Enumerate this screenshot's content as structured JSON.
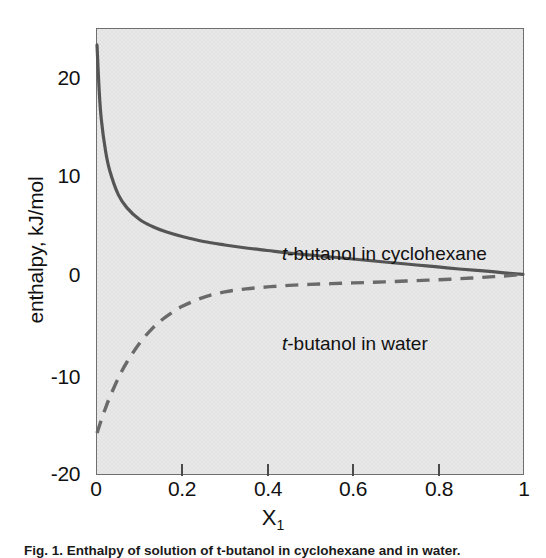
{
  "chart_data": {
    "type": "line",
    "title": "",
    "xlabel": "X1",
    "xlabel_base": "X",
    "xlabel_sub": "1",
    "ylabel": "enthalpy, kJ/mol",
    "xlim": [
      0,
      1
    ],
    "ylim": [
      -20,
      24.6
    ],
    "grid": false,
    "legend_position": "inline-annotations",
    "xticks": [
      "0",
      "0.2",
      "0.4",
      "0.6",
      "0.8",
      "1"
    ],
    "xtick_values": [
      0,
      0.2,
      0.4,
      0.6,
      0.8,
      1
    ],
    "yticks": [
      "20",
      "10",
      "0",
      "-10",
      "-20"
    ],
    "ytick_values": [
      20,
      10,
      0,
      -10,
      -20
    ],
    "plot_background_color": "#e2e2e2",
    "axis_color": "#6f6f6f",
    "series": [
      {
        "name": "t-butanol in cyclohexane",
        "style": "solid",
        "color": "#555555",
        "x": [
          0.0,
          0.005,
          0.01,
          0.02,
          0.03,
          0.05,
          0.07,
          0.1,
          0.13,
          0.16,
          0.2,
          0.25,
          0.3,
          0.35,
          0.4,
          0.45,
          0.5,
          0.55,
          0.6,
          0.65,
          0.7,
          0.75,
          0.8,
          0.85,
          0.9,
          0.95,
          1.0
        ],
        "y": [
          23.0,
          18.5,
          15.6,
          12.4,
          10.4,
          8.0,
          6.7,
          5.5,
          4.8,
          4.3,
          3.8,
          3.3,
          2.95,
          2.65,
          2.4,
          2.15,
          1.95,
          1.75,
          1.55,
          1.35,
          1.15,
          0.95,
          0.75,
          0.55,
          0.38,
          0.19,
          0.0
        ]
      },
      {
        "name": "t-butanol in water",
        "style": "dashed",
        "color": "#6a6a6a",
        "x": [
          0.0,
          0.01,
          0.02,
          0.03,
          0.05,
          0.07,
          0.1,
          0.13,
          0.16,
          0.2,
          0.25,
          0.3,
          0.35,
          0.4,
          0.45,
          0.5,
          0.55,
          0.6,
          0.65,
          0.7,
          0.75,
          0.8,
          0.85,
          0.9,
          0.95,
          1.0
        ],
        "y": [
          -15.9,
          -14.6,
          -13.4,
          -12.3,
          -10.4,
          -8.8,
          -6.9,
          -5.4,
          -4.3,
          -3.2,
          -2.3,
          -1.75,
          -1.45,
          -1.25,
          -1.1,
          -1.0,
          -0.92,
          -0.85,
          -0.78,
          -0.7,
          -0.62,
          -0.53,
          -0.43,
          -0.31,
          -0.17,
          0.0
        ]
      }
    ],
    "annotations": [
      {
        "text_italic": "t",
        "text_rest": "-butanol in cyclohexane",
        "x": 0.21,
        "y": 4.2
      },
      {
        "text_italic": "t",
        "text_rest": "-butanol in water",
        "x": 0.21,
        "y": -2.6
      }
    ]
  },
  "caption": {
    "text": "Fig. 1. Enthalpy of solution of t-butanol in cyclohexane and in water."
  }
}
